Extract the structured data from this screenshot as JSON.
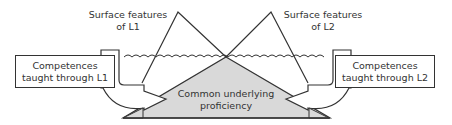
{
  "diagram": {
    "type": "dual-iceberg",
    "labels": {
      "surface_l1": [
        "Surface features",
        "of L1"
      ],
      "surface_l2": [
        "Surface features",
        "of L2"
      ],
      "competences_l1": [
        "Competences",
        "taught through L1"
      ],
      "competences_l2": [
        "Competences",
        "taught through L2"
      ],
      "cup": [
        "Common underlying",
        "proficiency"
      ]
    },
    "colors": {
      "stroke": "#333333",
      "cup_fill": "#d9d9d9",
      "background": "#ffffff",
      "text": "#333333"
    },
    "elements": [
      {
        "id": "iceberg-l1",
        "kind": "triangle",
        "label": "Surface features of L1"
      },
      {
        "id": "iceberg-l2",
        "kind": "triangle",
        "label": "Surface features of L2"
      },
      {
        "id": "waterline",
        "kind": "wavy-line"
      },
      {
        "id": "cup",
        "kind": "shaded-triangle",
        "label": "Common underlying proficiency"
      },
      {
        "id": "box-l1",
        "kind": "box",
        "label": "Competences taught through L1"
      },
      {
        "id": "box-l2",
        "kind": "box",
        "label": "Competences taught through L2"
      },
      {
        "id": "arrow-l1",
        "kind": "curved-arrow",
        "from": "box-l1",
        "to": "cup"
      },
      {
        "id": "arrow-l2",
        "kind": "curved-arrow",
        "from": "box-l2",
        "to": "cup"
      }
    ]
  }
}
